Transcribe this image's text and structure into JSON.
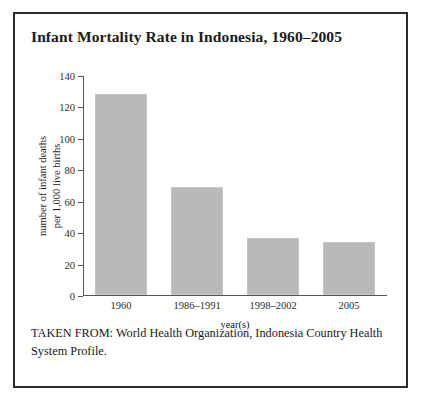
{
  "figure": {
    "title": "Infant Mortality Rate in Indonesia, 1960–2005",
    "source_note": "TAKEN FROM: World Health Organization, Indonesia Country Health System Profile.",
    "frame_color": "#2b2b2b"
  },
  "chart_data": {
    "type": "bar",
    "title": "Infant Mortality Rate in Indonesia, 1960–2005",
    "categories": [
      "1960",
      "1986–1991",
      "1998–2002",
      "2005"
    ],
    "values": [
      128,
      69,
      36,
      34
    ],
    "series": [
      {
        "name": "number of infant deaths per 1,000 live births",
        "values": [
          128,
          69,
          36,
          34
        ]
      }
    ],
    "xlabel": "year(s)",
    "ylabel": "number of infant deaths per 1,000 live births",
    "ylabel_line1": "number of infant deaths",
    "ylabel_line2": "per 1,000 live births",
    "ylim": [
      0,
      140
    ],
    "yticks": [
      0,
      20,
      40,
      60,
      80,
      100,
      120,
      140
    ],
    "ytick_labels": [
      "0",
      "20",
      "40",
      "60",
      "80",
      "100",
      "120",
      "140"
    ],
    "grid": false,
    "legend": false,
    "bar_color": "#b9b9b9",
    "axis_color": "#555555"
  }
}
